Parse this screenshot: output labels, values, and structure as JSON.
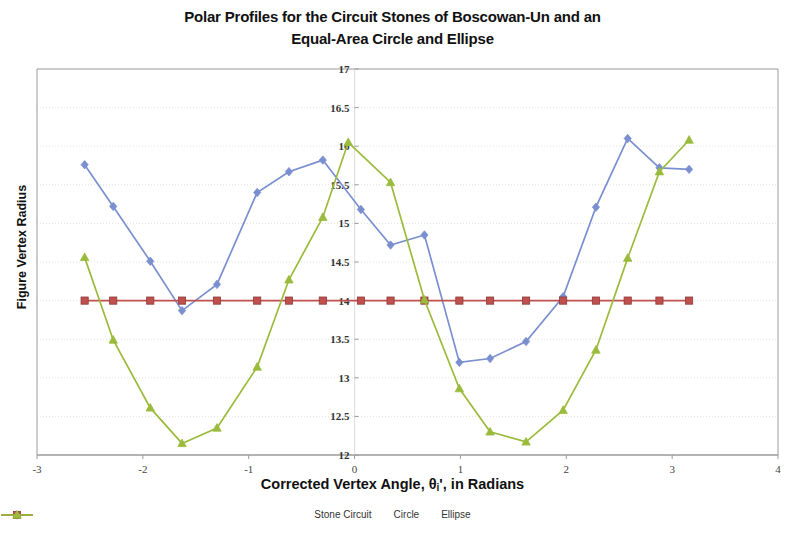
{
  "title": {
    "line1": "Polar Profiles for the Circuit Stones of Boscowan-Un and an",
    "line2": "Equal-Area Circle and Ellipse"
  },
  "axis": {
    "y_title": "Figure Vertex Radius",
    "x_title_prefix": "Corrected Vertex Angle, θ",
    "x_title_sub": "i",
    "x_title_suffix": "', in Radians"
  },
  "colors": {
    "stone_circuit": "#7a8fd0",
    "circle": "#c0504d",
    "ellipse": "#9bbb3c",
    "axis": "#9a9a9a",
    "grid": "#d9d9d9",
    "text": "#111111"
  },
  "legend": {
    "items": [
      {
        "label": "Stone Circuit",
        "color": "#7a8fd0",
        "marker": "diamond"
      },
      {
        "label": "Circle",
        "color": "#c0504d",
        "marker": "square"
      },
      {
        "label": "Ellipse",
        "color": "#9bbb3c",
        "marker": "triangle"
      }
    ]
  },
  "chart_data": {
    "type": "line",
    "title": "Polar Profiles for the Circuit Stones of Boscowan-Un and an Equal-Area Circle and Ellipse",
    "xlabel": "Corrected Vertex Angle, θi', in Radians",
    "ylabel": "Figure Vertex Radius",
    "xlim": [
      -3,
      4
    ],
    "ylim": [
      12,
      17
    ],
    "xticks": [
      -3,
      -2,
      -1,
      0,
      1,
      2,
      3,
      4
    ],
    "xtick_labels": [
      "-3",
      "-2",
      "-1",
      "0",
      "1",
      "2",
      "3",
      "4"
    ],
    "yticks": [
      12,
      12.5,
      13,
      13.5,
      14,
      14.5,
      15,
      15.5,
      16,
      16.5,
      17
    ],
    "ytick_labels": [
      "12",
      "12.5",
      "13",
      "13.5",
      "14",
      "14.5",
      "15",
      "15.5",
      "16",
      "16.5",
      "17"
    ],
    "grid": true,
    "legend_position": "bottom",
    "series": [
      {
        "name": "Stone Circuit",
        "color": "#7a8fd0",
        "marker": "diamond",
        "points": [
          [
            -2.55,
            15.76
          ],
          [
            -2.28,
            15.22
          ],
          [
            -1.93,
            14.51
          ],
          [
            -1.63,
            13.87
          ],
          [
            -1.3,
            14.21
          ],
          [
            -0.92,
            15.4
          ],
          [
            -0.62,
            15.67
          ],
          [
            -0.3,
            15.82
          ],
          [
            0.06,
            15.18
          ],
          [
            0.34,
            14.72
          ],
          [
            0.66,
            14.85
          ],
          [
            0.99,
            13.2
          ],
          [
            1.28,
            13.25
          ],
          [
            1.62,
            13.47
          ],
          [
            1.97,
            14.05
          ],
          [
            2.28,
            15.21
          ],
          [
            2.58,
            16.1
          ],
          [
            2.88,
            15.72
          ],
          [
            3.16,
            15.7
          ]
        ]
      },
      {
        "name": "Circle",
        "color": "#c0504d",
        "marker": "square",
        "points": [
          [
            -2.55,
            14.0
          ],
          [
            -2.28,
            14.0
          ],
          [
            -1.93,
            14.0
          ],
          [
            -1.63,
            14.0
          ],
          [
            -1.3,
            14.0
          ],
          [
            -0.92,
            14.0
          ],
          [
            -0.62,
            14.0
          ],
          [
            -0.3,
            14.0
          ],
          [
            0.06,
            14.0
          ],
          [
            0.34,
            14.0
          ],
          [
            0.66,
            14.0
          ],
          [
            0.99,
            14.0
          ],
          [
            1.28,
            14.0
          ],
          [
            1.62,
            14.0
          ],
          [
            1.97,
            14.0
          ],
          [
            2.28,
            14.0
          ],
          [
            2.58,
            14.0
          ],
          [
            2.88,
            14.0
          ],
          [
            3.16,
            14.0
          ]
        ]
      },
      {
        "name": "Ellipse",
        "color": "#9bbb3c",
        "marker": "triangle",
        "points": [
          [
            -2.55,
            14.56
          ],
          [
            -2.28,
            13.49
          ],
          [
            -1.93,
            12.61
          ],
          [
            -1.63,
            12.15
          ],
          [
            -1.3,
            12.35
          ],
          [
            -0.92,
            13.14
          ],
          [
            -0.62,
            14.27
          ],
          [
            -0.3,
            15.08
          ],
          [
            -0.06,
            16.05
          ],
          [
            0.34,
            15.53
          ],
          [
            0.66,
            14.01
          ],
          [
            0.99,
            12.86
          ],
          [
            1.28,
            12.3
          ],
          [
            1.62,
            12.17
          ],
          [
            1.97,
            12.58
          ],
          [
            2.28,
            13.36
          ],
          [
            2.58,
            14.55
          ],
          [
            2.88,
            15.67
          ],
          [
            3.16,
            16.08
          ]
        ]
      }
    ]
  }
}
